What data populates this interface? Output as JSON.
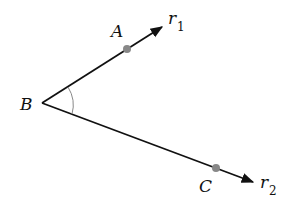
{
  "diagram": {
    "type": "angle",
    "vertex": {
      "label": "B",
      "x": 42,
      "y": 103
    },
    "rays": [
      {
        "name": "r",
        "subscript": "1",
        "tip": {
          "x": 162,
          "y": 27
        },
        "point": {
          "label": "A",
          "x": 127,
          "y": 49
        }
      },
      {
        "name": "r",
        "subscript": "2",
        "tip": {
          "x": 253,
          "y": 182
        },
        "point": {
          "label": "C",
          "x": 216,
          "y": 168
        }
      }
    ],
    "colors": {
      "line": "#111111",
      "point": "#888888",
      "arc": "#888888"
    }
  }
}
